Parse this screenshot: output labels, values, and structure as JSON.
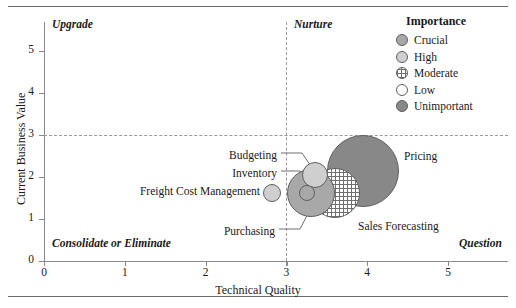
{
  "chart_data": {
    "type": "scatter",
    "title": "",
    "xlabel": "Technical Quality",
    "ylabel": "Current Business Value",
    "xlim": [
      0,
      5.7
    ],
    "ylim": [
      0,
      5.7
    ],
    "xticks": [
      0,
      1,
      2,
      3,
      4,
      5
    ],
    "yticks": [
      0,
      1,
      2,
      3,
      4,
      5
    ],
    "grid": false,
    "legend_position": "top-right",
    "reference_lines": {
      "x": 3,
      "y": 3
    },
    "quadrants": [
      {
        "key": "upper_left",
        "label": "Upgrade"
      },
      {
        "key": "upper_right",
        "label": "Nurture"
      },
      {
        "key": "lower_left",
        "label": "Consolidate or Eliminate"
      },
      {
        "key": "lower_right",
        "label": "Question"
      }
    ],
    "legend": {
      "title": "Importance",
      "entries": [
        {
          "label": "Crucial",
          "fill": "crucial"
        },
        {
          "label": "High",
          "fill": "high"
        },
        {
          "label": "Moderate",
          "fill": "moderate"
        },
        {
          "label": "Low",
          "fill": "low"
        },
        {
          "label": "Unimportant",
          "fill": "unimportant"
        }
      ]
    },
    "points": [
      {
        "label": "Pricing",
        "x": 3.95,
        "y": 2.15,
        "size": 36,
        "fill": "unimportant"
      },
      {
        "label": "Sales Forecasting",
        "x": 3.6,
        "y": 1.63,
        "size": 25,
        "fill": "moderate"
      },
      {
        "label": "Purchasing",
        "x": 3.3,
        "y": 1.62,
        "size": 24,
        "fill": "crucial"
      },
      {
        "label": "Budgeting",
        "x": 3.35,
        "y": 2.05,
        "size": 13,
        "fill": "high"
      },
      {
        "label": "Inventory",
        "x": 3.25,
        "y": 1.63,
        "size": 8,
        "fill": "crucial"
      },
      {
        "label": "Freight Cost Management",
        "x": 2.82,
        "y": 1.62,
        "size": 9,
        "fill": "high"
      }
    ]
  }
}
